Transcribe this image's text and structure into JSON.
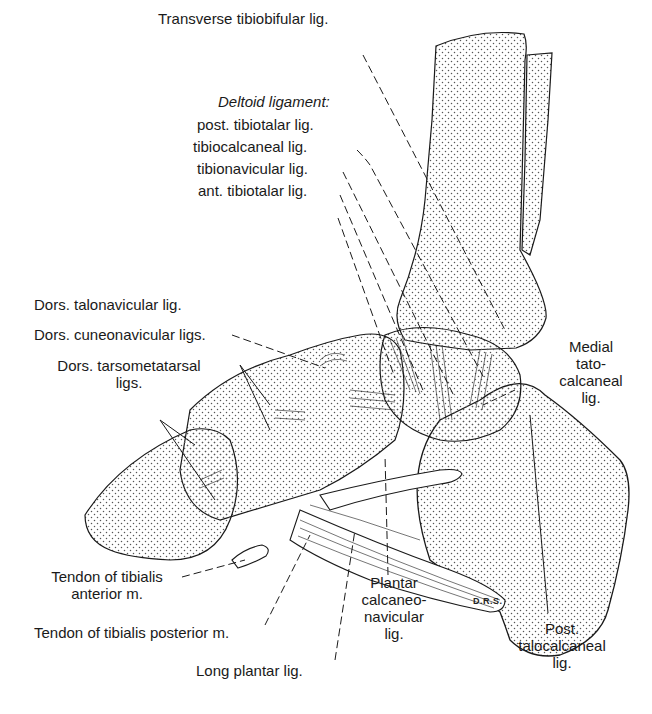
{
  "figure": {
    "signature": "D.R.S.",
    "colors": {
      "ink": "#1a1a1a",
      "stipple": "#555555",
      "background": "#ffffff"
    }
  },
  "labels": {
    "transverse_tibiofibular": "Transverse tibiobifular lig.",
    "deltoid_heading": "Deltoid ligament:",
    "post_tibiotalar": "post. tibiotalar lig.",
    "tibiocalcaneal": "tibiocalcaneal lig.",
    "tibionavicular": "tibionavicular lig.",
    "ant_tibiotalar": "ant. tibiotalar lig.",
    "dors_talonavicular": "Dors. talonavicular lig.",
    "dors_cuneonavicular": "Dors. cuneonavicular ligs.",
    "dors_tarsometatarsal": [
      "Dors. tarsometatarsal",
      "ligs."
    ],
    "medial_talocalcaneal": [
      "Medial",
      "tato-",
      "calcaneal",
      "lig."
    ],
    "tendon_tibialis_anterior": [
      "Tendon of tibialis",
      "anterior m."
    ],
    "tendon_tibialis_posterior": "Tendon of tibialis posterior m.",
    "long_plantar": "Long plantar lig.",
    "plantar_calcaneonavicular": [
      "Plantar",
      "calcaneo-",
      "navicular",
      "lig."
    ],
    "post_talocalcaneal": [
      "Post.",
      "talocalcaneal",
      "lig."
    ]
  }
}
